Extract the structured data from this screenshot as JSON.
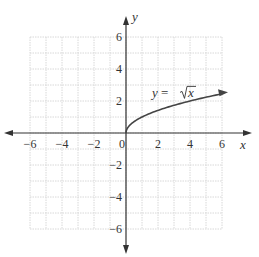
{
  "chart_data": {
    "type": "line",
    "title": "",
    "xlabel": "x",
    "ylabel": "y",
    "xlim": [
      -6,
      6
    ],
    "ylim": [
      -6,
      6
    ],
    "grid": true,
    "grid_step": 1,
    "x_ticks": [
      -6,
      -4,
      -2,
      0,
      2,
      4,
      6
    ],
    "y_ticks": [
      -6,
      -4,
      -2,
      2,
      4,
      6
    ],
    "x_tick_labels": [
      "−6",
      "−4",
      "−2",
      "0",
      "2",
      "4",
      "6"
    ],
    "y_tick_labels": [
      "−6",
      "−4",
      "−2",
      "2",
      "4",
      "6"
    ],
    "series": [
      {
        "name": "y = √x",
        "x": [
          0,
          0.25,
          0.5,
          1,
          2,
          3,
          4,
          5,
          6
        ],
        "y": [
          0,
          0.5,
          0.71,
          1,
          1.41,
          1.73,
          2,
          2.24,
          2.45
        ],
        "arrow_end": true
      }
    ],
    "annotations": [
      {
        "text_lhs": "y = ",
        "text_rad": "x",
        "x": 2.5,
        "y": 2.6
      }
    ]
  },
  "colors": {
    "axis": "#333333",
    "grid": "#d8d8d8",
    "curve": "#444444",
    "text": "#333333"
  }
}
